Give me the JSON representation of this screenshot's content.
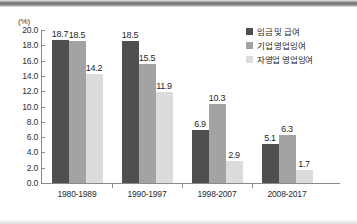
{
  "chart_data": {
    "type": "bar",
    "title": "",
    "xlabel": "",
    "ylabel": "(%)",
    "unit_label": "(%)",
    "ylim": [
      0.0,
      20.0
    ],
    "ytick_step": 2.0,
    "yticks": [
      "0.0",
      "2.0",
      "4.0",
      "6.0",
      "8.0",
      "10.0",
      "12.0",
      "14.0",
      "16.0",
      "18.0",
      "20.0"
    ],
    "grid": false,
    "legend_position": "top-right",
    "categories": [
      "1980-1989",
      "1990-1997",
      "1998-2007",
      "2008-2017"
    ],
    "series": [
      {
        "name": "임금 및 급여",
        "color": "#4f4f4f",
        "values": [
          18.7,
          18.5,
          6.9,
          5.1
        ],
        "labels": [
          "18.7",
          "18.5",
          "6.9",
          "5.1"
        ]
      },
      {
        "name": "기업 영업잉여",
        "color": "#a3a3a3",
        "values": [
          18.5,
          15.5,
          10.3,
          6.3
        ],
        "labels": [
          "18.5",
          "15.5",
          "10.3",
          "6.3"
        ]
      },
      {
        "name": "자영업 영업잉여",
        "color": "#dcdcdc",
        "values": [
          14.2,
          11.9,
          2.9,
          1.7
        ],
        "labels": [
          "14.2",
          "11.9",
          "2.9",
          "1.7"
        ]
      }
    ]
  }
}
